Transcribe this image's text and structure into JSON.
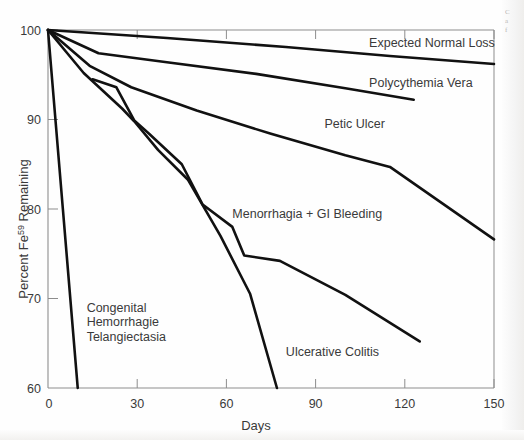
{
  "figure": {
    "background_color": "#fefefe",
    "ink_color": "#111111",
    "axis_color": "#8d8d8d",
    "text_color": "#3a3a3a",
    "margin_note_lines": [
      "C",
      "a",
      "f"
    ]
  },
  "chart_data": {
    "type": "line",
    "title": "",
    "subtitle": "",
    "xlabel": "Days",
    "ylabel": "Percent Fe59 Remaining",
    "ylabel_base": "Percent Fe",
    "ylabel_superscript": "59",
    "ylabel_tail": " Remaining",
    "xlim": [
      0,
      150
    ],
    "ylim": [
      60,
      100
    ],
    "xticks": [
      0,
      30,
      60,
      90,
      120,
      150
    ],
    "xtick_labels": [
      "0",
      "30",
      "60",
      "90",
      "120",
      "150"
    ],
    "yticks": [
      60,
      70,
      80,
      90,
      100
    ],
    "ytick_labels": [
      "60",
      "70",
      "80",
      "90",
      "100"
    ],
    "grid": false,
    "legend_position": "inline-labels",
    "series": [
      {
        "name": "Expected Normal Loss",
        "label": "Expected Normal Loss",
        "label_x": 108,
        "label_y": 98.1,
        "points": [
          [
            0,
            100.0
          ],
          [
            40,
            99.1
          ],
          [
            80,
            98.1
          ],
          [
            115,
            97.1
          ],
          [
            150,
            96.2
          ]
        ]
      },
      {
        "name": "Polycythemia Vera",
        "label": "Polycythemia Vera",
        "label_x": 108,
        "label_y": 93.6,
        "points": [
          [
            0,
            100.0
          ],
          [
            17,
            97.4
          ],
          [
            40,
            96.4
          ],
          [
            70,
            95.1
          ],
          [
            100,
            93.5
          ],
          [
            123,
            92.2
          ]
        ]
      },
      {
        "name": "Petic Ulcer",
        "label": "Petic Ulcer",
        "label_x": 93,
        "label_y": 89.0,
        "points": [
          [
            0,
            100.0
          ],
          [
            14,
            96.0
          ],
          [
            28,
            93.6
          ],
          [
            50,
            91.0
          ],
          [
            75,
            88.4
          ],
          [
            100,
            86.0
          ],
          [
            115,
            84.7
          ],
          [
            150,
            76.6
          ]
        ]
      },
      {
        "name": "Menorrhagia + GI Bleeding",
        "label": "Menorrhagia + GI Bleeding",
        "label_x": 62,
        "label_y": 79.0,
        "points": [
          [
            15,
            94.5
          ],
          [
            23,
            93.6
          ],
          [
            29,
            89.9
          ],
          [
            34,
            88.4
          ],
          [
            45,
            85.0
          ],
          [
            52,
            80.5
          ],
          [
            62,
            78.0
          ],
          [
            66,
            74.8
          ],
          [
            78,
            74.2
          ],
          [
            100,
            70.4
          ],
          [
            125,
            65.2
          ]
        ]
      },
      {
        "name": "Ulcerative Colitis",
        "label": "Ulcerative Colitis",
        "label_x": 80,
        "label_y": 63.6,
        "points": [
          [
            0,
            100.0
          ],
          [
            12,
            95.2
          ],
          [
            25,
            91.2
          ],
          [
            29,
            89.8
          ],
          [
            37,
            86.6
          ],
          [
            47,
            83.3
          ],
          [
            58,
            77.0
          ],
          [
            68,
            70.5
          ],
          [
            77,
            60.0
          ]
        ]
      },
      {
        "name": "Congenital Hemorrhagie Telangiectasia",
        "label_lines": [
          "Congenital",
          "Hemorrhagie",
          "Telangiectasia"
        ],
        "label_x": 13,
        "label_y": 68.5,
        "points": [
          [
            0,
            100.0
          ],
          [
            5,
            80.0
          ],
          [
            10,
            60.0
          ]
        ]
      }
    ]
  }
}
